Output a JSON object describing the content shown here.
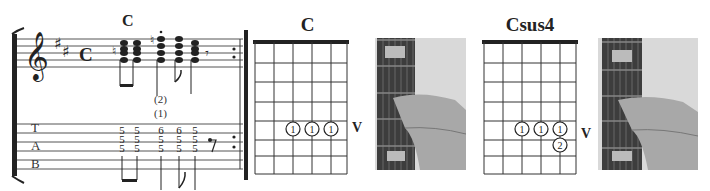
{
  "notation": {
    "chord_label": "C",
    "key_signature": "2 sharps",
    "time_signature": "C",
    "string_indicators": [
      "(2)",
      "(1)"
    ],
    "tab_letters": [
      "T",
      "A",
      "B"
    ],
    "tab_columns": [
      [
        "5",
        "5",
        "5"
      ],
      [
        "5",
        "5",
        "5"
      ],
      [
        "6",
        "5",
        "5"
      ],
      [
        "6",
        "5",
        "5"
      ],
      [
        "5",
        "5",
        "5"
      ]
    ]
  },
  "diagrams": [
    {
      "name": "C",
      "fret_label": "V",
      "dots": [
        {
          "string": 3,
          "fret": 5,
          "finger": "1"
        },
        {
          "string": 4,
          "fret": 5,
          "finger": "1"
        },
        {
          "string": 5,
          "fret": 5,
          "finger": "1"
        }
      ]
    },
    {
      "name": "Csus4",
      "fret_label": "V",
      "dots": [
        {
          "string": 3,
          "fret": 5,
          "finger": "1"
        },
        {
          "string": 4,
          "fret": 5,
          "finger": "1"
        },
        {
          "string": 5,
          "fret": 5,
          "finger": "1"
        },
        {
          "string": 5,
          "fret": 6,
          "finger": "2"
        }
      ]
    }
  ],
  "photos": [
    "hand-on-fretboard-c",
    "hand-on-fretboard-csus4"
  ]
}
